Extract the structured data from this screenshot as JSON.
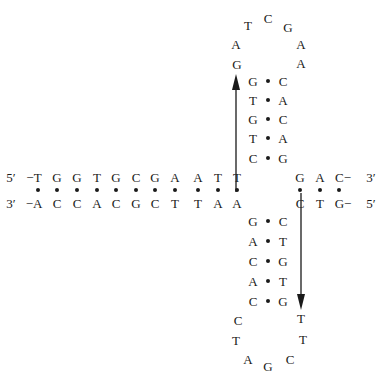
{
  "diagram": {
    "colors": {
      "ink": "#1a1a1a",
      "background": "#ffffff"
    },
    "duplex": {
      "top_strand": {
        "left_label": "5′",
        "right_label": "3′",
        "left": [
          "−T",
          "G",
          "G",
          "T",
          "G",
          "C",
          "G",
          "A",
          "A",
          "T",
          "T"
        ],
        "right": [
          "G",
          "A",
          "C−"
        ]
      },
      "bottom_strand": {
        "left_label": "3′",
        "right_label": "5′",
        "left": [
          "−A",
          "C",
          "C",
          "A",
          "C",
          "G",
          "C",
          "T",
          "T",
          "A",
          "A"
        ],
        "right": [
          "C",
          "T",
          "G−"
        ]
      }
    },
    "upper_hairpin": {
      "stem": [
        {
          "left": "G",
          "right": "C"
        },
        {
          "left": "T",
          "right": "A"
        },
        {
          "left": "G",
          "right": "C"
        },
        {
          "left": "T",
          "right": "A"
        },
        {
          "left": "C",
          "right": "G"
        }
      ],
      "loop": [
        "G",
        "A",
        "T",
        "C",
        "G",
        "A",
        "A"
      ]
    },
    "lower_hairpin": {
      "stem": [
        {
          "left": "G",
          "right": "C"
        },
        {
          "left": "A",
          "right": "T"
        },
        {
          "left": "C",
          "right": "G"
        },
        {
          "left": "A",
          "right": "T"
        },
        {
          "left": "C",
          "right": "G"
        }
      ],
      "loop": [
        "C",
        "T",
        "A",
        "G",
        "C",
        "T",
        "T"
      ]
    },
    "arrows": [
      {
        "direction": "up",
        "label": "upper-arm-strand-direction"
      },
      {
        "direction": "down",
        "label": "lower-arm-strand-direction"
      }
    ]
  }
}
